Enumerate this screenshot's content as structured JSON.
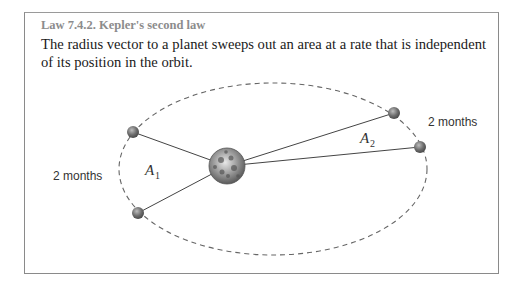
{
  "law": {
    "title": "Law 7.4.2. Kepler's second law",
    "body": "The radius vector to a planet sweeps out an area at a rate that is independent of its position in the orbit."
  },
  "diagram": {
    "labels": {
      "left_interval": "2 months",
      "right_interval": "2 months",
      "area1_symbol": "A",
      "area1_subscript": "1",
      "area2_symbol": "A",
      "area2_subscript": "2"
    },
    "icons": {
      "sun": "sun-icon",
      "planet": "planet-icon"
    },
    "colors": {
      "orbit": "#666666",
      "radius_line": "#444444",
      "sun_fill": "#8a8a8a",
      "planet_fill": "#6e6e6e",
      "border": "#8a8a8a",
      "title": "#8c8c8c"
    }
  }
}
